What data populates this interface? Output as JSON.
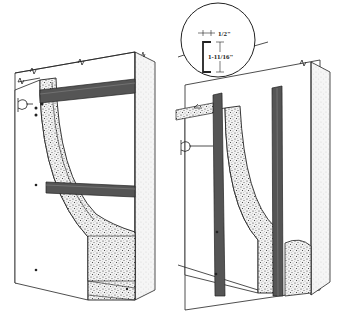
{
  "diagram": {
    "left_figure": {
      "name": "horizontal-channel-installation",
      "channel_orientation": "horizontal",
      "channel_count": 2
    },
    "right_figure": {
      "name": "vertical-channel-installation",
      "channel_orientation": "vertical",
      "channel_count": 2
    },
    "detail_callout": {
      "name": "channel-profile-detail",
      "flange_dimension": "1/2\"",
      "depth_dimension": "1-11/16\""
    },
    "colors": {
      "line": "#222222",
      "channel": "#555555",
      "insulation_bg": "#e8e8e8",
      "background": "#ffffff"
    }
  }
}
